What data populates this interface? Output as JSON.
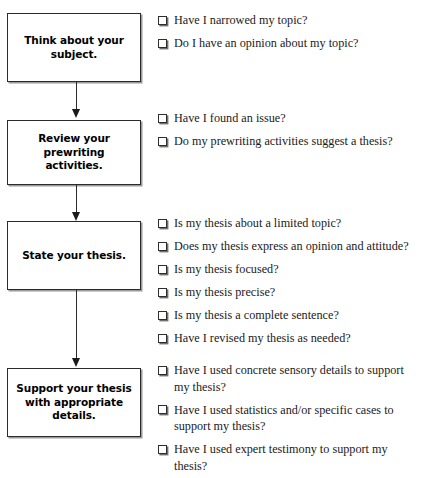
{
  "diagram": {
    "type": "vertical-flowchart-with-checklists",
    "colors": {
      "background": "#ffffff",
      "box_border": "#2b2b2b",
      "box_shadow": "#9a9a9a",
      "text": "#1a1a1a",
      "box_label_text": "#000000",
      "connector": "#2b2b2b",
      "checkbox_border": "#2e2e2e",
      "checkbox_shadow": "#6f6f6f"
    },
    "stages": [
      {
        "id": "think-about-subject",
        "box_label": "Think about your subject.",
        "checklist": [
          "Have I narrowed my topic?",
          "Do I have an opinion about my topic?"
        ]
      },
      {
        "id": "review-prewriting",
        "box_label": "Review your prewriting activities.",
        "checklist": [
          "Have I found an issue?",
          "Do my prewriting activities suggest a thesis?"
        ]
      },
      {
        "id": "state-thesis",
        "box_label": "State your thesis.",
        "checklist": [
          "Is my thesis about a limited topic?",
          "Does my thesis express an opinion and attitude?",
          "Is my thesis focused?",
          "Is my thesis precise?",
          "Is my thesis a complete sentence?",
          "Have I revised my thesis as needed?"
        ]
      },
      {
        "id": "support-thesis",
        "box_label": "Support your thesis with appropriate details.",
        "checklist": [
          "Have I used concrete sensory details to support my thesis?",
          "Have I used statistics and/or specific cases to support my thesis?",
          "Have I used expert testimony to support my thesis?"
        ]
      }
    ],
    "connectors": [
      {
        "id": "connector-1",
        "from": "think-about-subject",
        "to": "review-prewriting"
      },
      {
        "id": "connector-2",
        "from": "review-prewriting",
        "to": "state-thesis"
      },
      {
        "id": "connector-3",
        "from": "state-thesis",
        "to": "support-thesis"
      }
    ]
  }
}
